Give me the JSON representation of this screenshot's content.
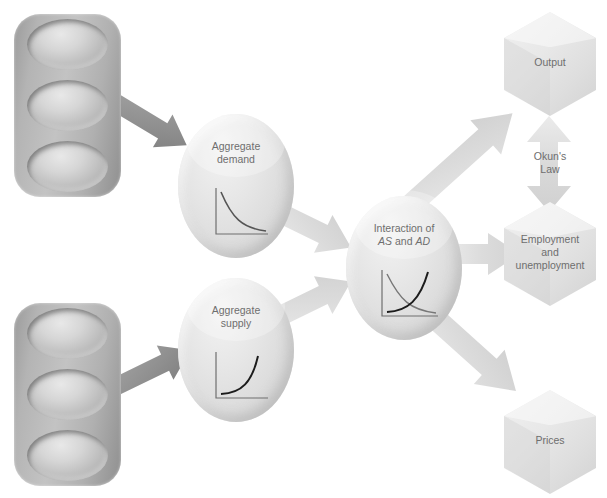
{
  "diagram": {
    "nodes": {
      "aggregate_demand": {
        "label_line1": "Aggregate",
        "label_line2": "demand",
        "chart": "downward-sloping-curve"
      },
      "aggregate_supply": {
        "label_line1": "Aggregate",
        "label_line2": "supply",
        "chart": "upward-sloping-curve"
      },
      "interaction": {
        "label_line1": "Interaction of",
        "label_as": "AS",
        "label_and": " and ",
        "label_ad": "AD",
        "chart": "crossing-curves"
      }
    },
    "outcomes": {
      "output": {
        "label": "Output"
      },
      "employment": {
        "label_line1": "Employment",
        "label_line2": "and",
        "label_line3": "unemployment"
      },
      "prices": {
        "label": "Prices"
      }
    },
    "connector": {
      "okun_line1": "Okun's",
      "okun_line2": "Law"
    },
    "colors": {
      "text": "#6e6e6e",
      "arrow_dark": "#8a8a8a",
      "arrow_light": "#e2e2e2",
      "arrow_mid": "#d8d8d8",
      "node_fill": "#e2e2e2",
      "hex_fill": "#e6e6e6",
      "panel_fill": "#b4b4b4",
      "curve_stroke": "#555555"
    }
  }
}
